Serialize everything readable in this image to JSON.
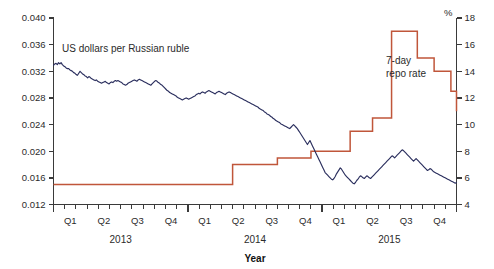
{
  "chart_data": {
    "type": "line",
    "title": "",
    "subtitle": "",
    "xlabel": "Year",
    "ylabel_left": "",
    "ylabel_right": "%",
    "grid": false,
    "legend_position": "inline-annotation",
    "x_axis": {
      "quarter_ticks": [
        "Q1",
        "Q2",
        "Q3",
        "Q4",
        "Q1",
        "Q2",
        "Q3",
        "Q4",
        "Q1",
        "Q2",
        "Q3",
        "Q4"
      ],
      "year_groups": [
        "2013",
        "2014",
        "2015"
      ],
      "range_start": "2013-01",
      "range_end": "2015-12",
      "minor_tick_interval": "month"
    },
    "y_axis_left": {
      "ticks": [
        "0.012",
        "0.016",
        "0.020",
        "0.024",
        "0.028",
        "0.032",
        "0.036",
        "0.040"
      ],
      "values": [
        0.012,
        0.016,
        0.02,
        0.024,
        0.028,
        0.032,
        0.036,
        0.04
      ],
      "min": 0.012,
      "max": 0.04,
      "step": 0.004
    },
    "y_axis_right": {
      "ticks": [
        "4",
        "6",
        "8",
        "10",
        "12",
        "14",
        "16",
        "18"
      ],
      "values": [
        4,
        6,
        8,
        10,
        12,
        14,
        16,
        18
      ],
      "min": 4,
      "max": 18,
      "step": 2,
      "unit": "%"
    },
    "series": [
      {
        "name": "US dollars per Russian ruble",
        "axis": "left",
        "color": "#2b2f5e",
        "annotation_label": "US dollars per Russian ruble",
        "values": [
          0.0329,
          0.0331,
          0.0332,
          0.033,
          0.0333,
          0.0331,
          0.0333,
          0.033,
          0.0328,
          0.0327,
          0.0325,
          0.0324,
          0.0324,
          0.0322,
          0.0321,
          0.032,
          0.0318,
          0.0317,
          0.0315,
          0.0314,
          0.0317,
          0.032,
          0.0318,
          0.0316,
          0.0315,
          0.0313,
          0.0312,
          0.031,
          0.0312,
          0.0311,
          0.0309,
          0.0308,
          0.0307,
          0.0306,
          0.0307,
          0.0305,
          0.0304,
          0.0303,
          0.0302,
          0.0303,
          0.0304,
          0.0305,
          0.0303,
          0.0302,
          0.0301,
          0.0303,
          0.0304,
          0.0303,
          0.0305,
          0.0306,
          0.0305,
          0.0306,
          0.0305,
          0.0304,
          0.0303,
          0.0301,
          0.03,
          0.0299,
          0.03,
          0.0302,
          0.0303,
          0.0304,
          0.0305,
          0.0306,
          0.0307,
          0.0306,
          0.0305,
          0.0307,
          0.0308,
          0.0307,
          0.0306,
          0.0305,
          0.0304,
          0.0303,
          0.0302,
          0.0301,
          0.03,
          0.0299,
          0.0301,
          0.0303,
          0.0305,
          0.0306,
          0.0305,
          0.0303,
          0.0302,
          0.03,
          0.0299,
          0.0297,
          0.0295,
          0.0293,
          0.0291,
          0.029,
          0.0288,
          0.0287,
          0.0286,
          0.0285,
          0.0284,
          0.0283,
          0.0281,
          0.028,
          0.0279,
          0.0278,
          0.0277,
          0.0278,
          0.0279,
          0.028,
          0.0279,
          0.0278,
          0.0279,
          0.028,
          0.0281,
          0.0282,
          0.0283,
          0.0285,
          0.0286,
          0.0287,
          0.0286,
          0.0288,
          0.0289,
          0.0288,
          0.0287,
          0.0289,
          0.029,
          0.0291,
          0.029,
          0.0289,
          0.0288,
          0.0287,
          0.0286,
          0.0288,
          0.0289,
          0.029,
          0.0289,
          0.0288,
          0.0287,
          0.0286,
          0.0285,
          0.0287,
          0.0288,
          0.0289,
          0.0288,
          0.0287,
          0.0286,
          0.0285,
          0.0284,
          0.0283,
          0.0282,
          0.0281,
          0.028,
          0.0279,
          0.0278,
          0.0277,
          0.0276,
          0.0275,
          0.0274,
          0.0273,
          0.0272,
          0.0271,
          0.027,
          0.0269,
          0.0268,
          0.0267,
          0.0266,
          0.0264,
          0.0263,
          0.0262,
          0.0261,
          0.0259,
          0.0258,
          0.0256,
          0.0255,
          0.0254,
          0.0252,
          0.0251,
          0.0249,
          0.0248,
          0.0246,
          0.0245,
          0.0244,
          0.0243,
          0.0241,
          0.024,
          0.0239,
          0.0238,
          0.0237,
          0.0236,
          0.0235,
          0.0234,
          0.0236,
          0.0238,
          0.024,
          0.0238,
          0.0236,
          0.0234,
          0.0231,
          0.0228,
          0.0225,
          0.0222,
          0.0219,
          0.0216,
          0.0213,
          0.021,
          0.0213,
          0.0216,
          0.0212,
          0.0208,
          0.0204,
          0.02,
          0.0196,
          0.0192,
          0.0188,
          0.0184,
          0.018,
          0.0176,
          0.0172,
          0.0168,
          0.0166,
          0.0164,
          0.0162,
          0.016,
          0.0158,
          0.0157,
          0.0159,
          0.0162,
          0.0166,
          0.0169,
          0.0172,
          0.0175,
          0.0173,
          0.017,
          0.0167,
          0.0164,
          0.0162,
          0.016,
          0.0158,
          0.0156,
          0.0154,
          0.0152,
          0.0151,
          0.0153,
          0.0156,
          0.0158,
          0.0161,
          0.0163,
          0.0162,
          0.016,
          0.0159,
          0.0161,
          0.0163,
          0.0162,
          0.016,
          0.0159,
          0.0161,
          0.0163,
          0.0165,
          0.0167,
          0.0169,
          0.0171,
          0.0173,
          0.0175,
          0.0177,
          0.0179,
          0.0181,
          0.0183,
          0.0185,
          0.0187,
          0.0189,
          0.0191,
          0.0193,
          0.0192,
          0.019,
          0.0192,
          0.0194,
          0.0196,
          0.0198,
          0.02,
          0.0202,
          0.0201,
          0.0199,
          0.0197,
          0.0195,
          0.0193,
          0.0191,
          0.0189,
          0.0187,
          0.0185,
          0.0187,
          0.0189,
          0.0187,
          0.0185,
          0.0183,
          0.0181,
          0.0179,
          0.0177,
          0.0175,
          0.0173,
          0.0171,
          0.0172,
          0.0174,
          0.0173,
          0.0171,
          0.0169,
          0.0168,
          0.0167,
          0.0166,
          0.0165,
          0.0164,
          0.0163,
          0.0162,
          0.0161,
          0.016,
          0.0159,
          0.0158,
          0.0157,
          0.0156,
          0.0155,
          0.0154,
          0.0153,
          0.0152,
          0.0153
        ]
      },
      {
        "name": "7-day repo rate",
        "axis": "right",
        "color": "#c0563a",
        "annotation_label_line1": "7-day",
        "annotation_label_line2": "repo rate",
        "steps": [
          {
            "x": 0.0,
            "value": 5.5
          },
          {
            "x": 16.0,
            "value": 7.0
          },
          {
            "x": 20.0,
            "value": 7.5
          },
          {
            "x": 23.0,
            "value": 8.0
          },
          {
            "x": 26.5,
            "value": 9.5
          },
          {
            "x": 28.5,
            "value": 10.5
          },
          {
            "x": 30.2,
            "value": 17.0
          },
          {
            "x": 32.5,
            "value": 15.0
          },
          {
            "x": 34.0,
            "value": 14.0
          },
          {
            "x": 35.5,
            "value": 12.5
          },
          {
            "x": 37.0,
            "value": 11.5
          },
          {
            "x": 38.5,
            "value": 11.0
          },
          {
            "x": 47.0,
            "value": 11.0
          }
        ]
      }
    ]
  }
}
